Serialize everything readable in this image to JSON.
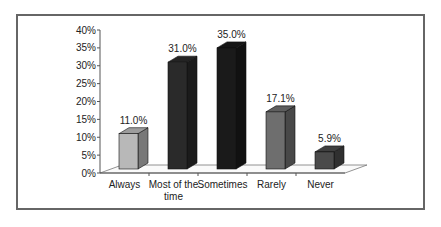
{
  "chart_data": {
    "type": "bar",
    "title": "",
    "xlabel": "",
    "ylabel": "",
    "categories": [
      "Always",
      "Most of the time",
      "Sometimes",
      "Rarely",
      "Never"
    ],
    "category_lines": [
      [
        "Always"
      ],
      [
        "Most of the",
        "time"
      ],
      [
        "Sometimes"
      ],
      [
        "Rarely"
      ],
      [
        "Never"
      ]
    ],
    "values": [
      11.0,
      31.0,
      35.0,
      17.1,
      5.9
    ],
    "value_labels": [
      "11.0%",
      "31.0%",
      "35.0%",
      "17.1%",
      "5.9%"
    ],
    "bar_colors": [
      "#b8b8b8",
      "#2a2a2a",
      "#1a1a1a",
      "#6e6e6e",
      "#4a4a4a"
    ],
    "ylim": [
      0,
      40
    ],
    "yticks": [
      0,
      5,
      10,
      15,
      20,
      25,
      30,
      35,
      40
    ],
    "ytick_labels": [
      "0%",
      "5%",
      "10%",
      "15%",
      "20%",
      "25%",
      "30%",
      "35%",
      "40%"
    ],
    "grid": false,
    "legend": null,
    "style": "3d-bar"
  }
}
